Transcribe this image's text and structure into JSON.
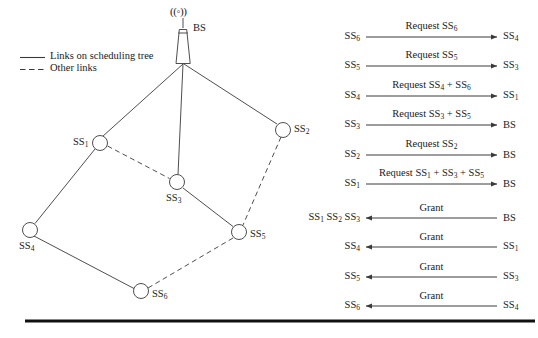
{
  "figure": {
    "background": "#ffffff",
    "line_color": "#3a3a3a",
    "text_color": "#1a1a1a",
    "rule_color": "#111111"
  },
  "legend": {
    "items": [
      {
        "style": "solid",
        "label": "Links on scheduling tree"
      },
      {
        "style": "dashed",
        "label": "Other links"
      }
    ]
  },
  "network": {
    "base_station": {
      "id": "BS",
      "label": "BS",
      "antenna_glyph": "((◦))",
      "x": 183,
      "y": 63
    },
    "nodes": [
      {
        "id": "SS1",
        "label_main": "SS",
        "label_sub": "1",
        "x": 100,
        "y": 143,
        "label_side": "left"
      },
      {
        "id": "SS2",
        "label_main": "SS",
        "label_sub": "2",
        "x": 283,
        "y": 130,
        "label_side": "right"
      },
      {
        "id": "SS3",
        "label_main": "SS",
        "label_sub": "3",
        "x": 177,
        "y": 182,
        "label_side": "below"
      },
      {
        "id": "SS4",
        "label_main": "SS",
        "label_sub": "4",
        "x": 30,
        "y": 230,
        "label_side": "below-left"
      },
      {
        "id": "SS5",
        "label_main": "SS",
        "label_sub": "5",
        "x": 239,
        "y": 232,
        "label_side": "right"
      },
      {
        "id": "SS6",
        "label_main": "SS",
        "label_sub": "6",
        "x": 141,
        "y": 291,
        "label_side": "right"
      }
    ],
    "edges": [
      {
        "from": "BS",
        "to": "SS1",
        "style": "solid"
      },
      {
        "from": "BS",
        "to": "SS3",
        "style": "solid"
      },
      {
        "from": "BS",
        "to": "SS2",
        "style": "solid"
      },
      {
        "from": "SS1",
        "to": "SS4",
        "style": "solid"
      },
      {
        "from": "SS1",
        "to": "SS3",
        "style": "dashed"
      },
      {
        "from": "SS3",
        "to": "SS5",
        "style": "solid"
      },
      {
        "from": "SS2",
        "to": "SS5",
        "style": "dashed"
      },
      {
        "from": "SS4",
        "to": "SS6",
        "style": "solid"
      },
      {
        "from": "SS5",
        "to": "SS6",
        "style": "dashed"
      }
    ]
  },
  "sequence": {
    "arrow_start_x": 366,
    "arrow_end_x": 497,
    "left_label_x": 360,
    "right_label_x": 503,
    "rows": [
      {
        "y": 37,
        "direction": "right",
        "source": "SS₆",
        "source_main": "SS",
        "source_sub": "6",
        "target_main": "SS",
        "target_sub": "4",
        "message_parts": [
          {
            "text": "Request SS",
            "sub": "6"
          }
        ],
        "message_plain": "Request SS6"
      },
      {
        "y": 66,
        "direction": "right",
        "source_main": "SS",
        "source_sub": "5",
        "target_main": "SS",
        "target_sub": "3",
        "message_parts": [
          {
            "text": "Request SS",
            "sub": "5"
          }
        ],
        "message_plain": "Request SS5"
      },
      {
        "y": 96,
        "direction": "right",
        "source_main": "SS",
        "source_sub": "4",
        "target_main": "SS",
        "target_sub": "1",
        "message_parts": [
          {
            "text": "Request SS",
            "sub": "4"
          },
          {
            "text": " + SS",
            "sub": "6"
          }
        ],
        "message_plain": "Request SS4 + SS6"
      },
      {
        "y": 125,
        "direction": "right",
        "source_main": "SS",
        "source_sub": "3",
        "target_main": "BS",
        "target_sub": "",
        "message_parts": [
          {
            "text": "Request SS",
            "sub": "3"
          },
          {
            "text": " + SS",
            "sub": "5"
          }
        ],
        "message_plain": "Request SS3 + SS5"
      },
      {
        "y": 155,
        "direction": "right",
        "source_main": "SS",
        "source_sub": "2",
        "target_main": "BS",
        "target_sub": "",
        "message_parts": [
          {
            "text": "Request SS",
            "sub": "2"
          }
        ],
        "message_plain": "Request SS2"
      },
      {
        "y": 184,
        "direction": "right",
        "source_main": "SS",
        "source_sub": "1",
        "target_main": "BS",
        "target_sub": "",
        "message_parts": [
          {
            "text": "Request SS",
            "sub": "1"
          },
          {
            "text": " + SS",
            "sub": "3"
          },
          {
            "text": " + SS",
            "sub": "5"
          }
        ],
        "message_plain": "Request SS1 + SS3 + SS5"
      },
      {
        "y": 218,
        "direction": "left",
        "source_multi": [
          {
            "main": "SS",
            "sub": "1"
          },
          {
            "main": "SS",
            "sub": "2"
          },
          {
            "main": "SS",
            "sub": "3"
          }
        ],
        "target_main": "BS",
        "target_sub": "",
        "message_parts": [
          {
            "text": "Grant",
            "sub": ""
          }
        ],
        "message_plain": "Grant"
      },
      {
        "y": 247,
        "direction": "left",
        "source_main": "SS",
        "source_sub": "4",
        "target_main": "SS",
        "target_sub": "1",
        "message_parts": [
          {
            "text": "Grant",
            "sub": ""
          }
        ],
        "message_plain": "Grant"
      },
      {
        "y": 277,
        "direction": "left",
        "source_main": "SS",
        "source_sub": "5",
        "target_main": "SS",
        "target_sub": "3",
        "message_parts": [
          {
            "text": "Grant",
            "sub": ""
          }
        ],
        "message_plain": "Grant"
      },
      {
        "y": 306,
        "direction": "left",
        "source_main": "SS",
        "source_sub": "6",
        "target_main": "SS",
        "target_sub": "4",
        "message_parts": [
          {
            "text": "Grant",
            "sub": ""
          }
        ],
        "message_plain": "Grant"
      }
    ]
  },
  "footer_rule": {
    "x1": 25,
    "x2": 535,
    "y": 321,
    "thickness": 3
  }
}
